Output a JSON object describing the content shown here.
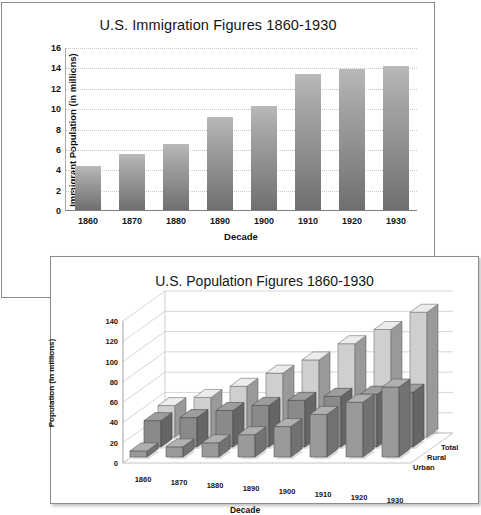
{
  "chart_data": [
    {
      "type": "bar",
      "id": "immigration",
      "title": "U.S. Immigration Figures 1860-1930",
      "xlabel": "Decade",
      "ylabel": "Immigrant Population (in millions)",
      "categories": [
        "1860",
        "1870",
        "1880",
        "1890",
        "1900",
        "1910",
        "1920",
        "1930"
      ],
      "values": [
        4.3,
        5.5,
        6.5,
        9.1,
        10.2,
        13.4,
        13.8,
        14.1
      ],
      "yticks": [
        0,
        2,
        4,
        6,
        8,
        10,
        12,
        14,
        16
      ],
      "ylim": [
        0,
        16
      ],
      "grid": true,
      "legend": "none",
      "bar_color": "#8c8c8c"
    },
    {
      "type": "bar",
      "id": "population",
      "subtype": "3d-grouped",
      "title": "U.S. Population Figures 1860-1930",
      "xlabel": "Decade",
      "ylabel": "Population (in millions)",
      "categories": [
        "1860",
        "1870",
        "1880",
        "1890",
        "1900",
        "1910",
        "1920",
        "1930"
      ],
      "series": [
        {
          "name": "Urban",
          "values": [
            6,
            10,
            14,
            22,
            30,
            42,
            54,
            69
          ],
          "color": "#9a9a9a"
        },
        {
          "name": "Rural",
          "values": [
            26,
            29,
            36,
            41,
            46,
            50,
            52,
            54
          ],
          "color": "#8a8a8a"
        },
        {
          "name": "Total",
          "values": [
            31,
            39,
            50,
            63,
            76,
            92,
            106,
            123
          ],
          "color": "#cfcfcf"
        }
      ],
      "yticks": [
        0,
        20,
        40,
        60,
        80,
        100,
        120,
        140
      ],
      "ylim": [
        0,
        140
      ],
      "grid": true,
      "legend": "right-depth-axis"
    }
  ]
}
